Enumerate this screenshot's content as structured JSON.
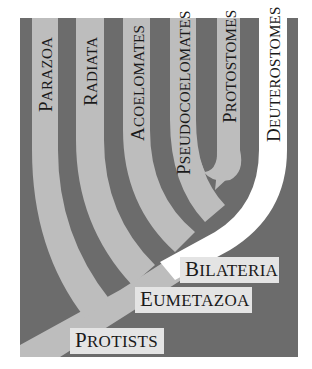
{
  "diagram": {
    "colors": {
      "background": "#6c6c6c",
      "clade_band": "#bdbdbd",
      "deuterostome_band": "#ffffff",
      "label_box": "#e4e4e4",
      "text": "#1a1a1a"
    },
    "top_clades": [
      {
        "id": "parazoa",
        "first": "P",
        "rest": "ARAZOA",
        "label": "Parazoa"
      },
      {
        "id": "radiata",
        "first": "R",
        "rest": "ADIATA",
        "label": "Radiata"
      },
      {
        "id": "acoelomates",
        "first": "A",
        "rest": "COELOMATES",
        "label": "Acoelomates"
      },
      {
        "id": "pseudocoelomates",
        "first": "P",
        "rest": "SEUDOCOELOMATES",
        "label": "Pseudocoelomates"
      },
      {
        "id": "protostomes",
        "first": "P",
        "rest": "ROTOSTOMES",
        "label": "Protostomes"
      },
      {
        "id": "deuterostomes",
        "first": "D",
        "rest": "EUTEROSTOMES",
        "label": "Deuterostomes"
      }
    ],
    "branch_labels": [
      {
        "id": "bilateria",
        "first": "B",
        "rest": "ILATERIA",
        "label": "Bilateria"
      },
      {
        "id": "eumetazoa",
        "first": "E",
        "rest": "UMETAZOA",
        "label": "Eumetazoa"
      },
      {
        "id": "protists",
        "first": "P",
        "rest": "ROTISTS",
        "label": "Protists"
      }
    ]
  }
}
